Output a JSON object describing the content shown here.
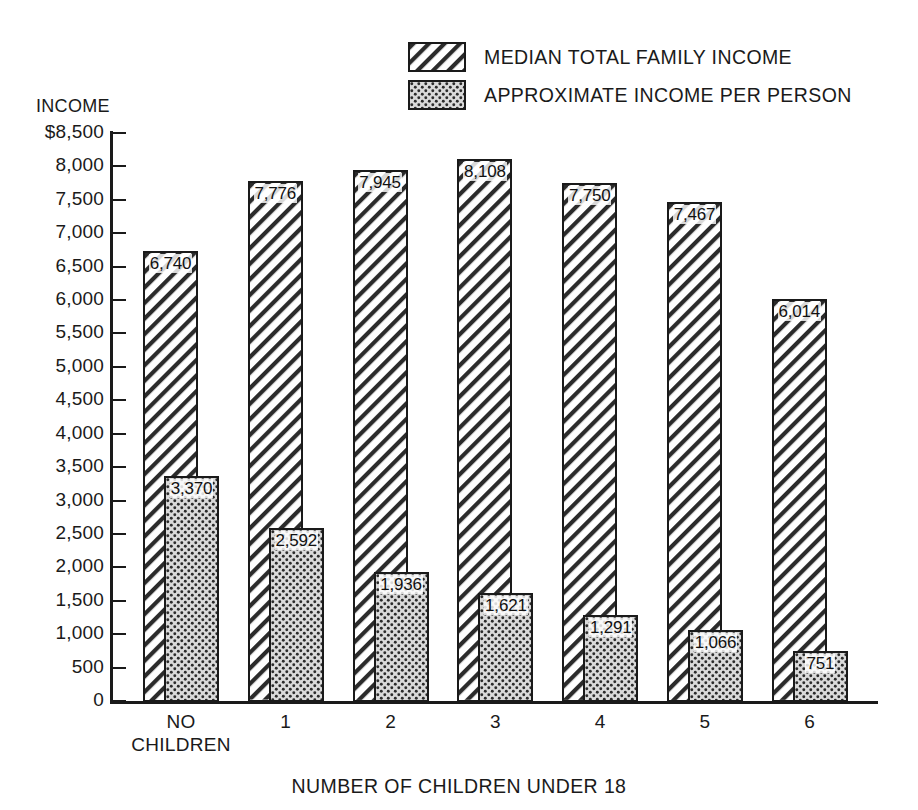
{
  "legend": {
    "items": [
      {
        "label": "MEDIAN TOTAL FAMILY INCOME",
        "pattern": "diagonal-hatch",
        "icon": "hatch-swatch-icon"
      },
      {
        "label": "APPROXIMATE INCOME PER PERSON",
        "pattern": "dotted",
        "icon": "dot-swatch-icon"
      }
    ]
  },
  "axes": {
    "y_caption": "INCOME",
    "x_title": "NUMBER OF CHILDREN UNDER 18"
  },
  "chart_data": {
    "type": "bar",
    "title": "",
    "xlabel": "NUMBER OF CHILDREN UNDER 18",
    "ylabel": "INCOME",
    "ylim": [
      0,
      8500
    ],
    "ytick_values": [
      0,
      500,
      1000,
      1500,
      2000,
      2500,
      3000,
      3500,
      4000,
      4500,
      5000,
      5500,
      6000,
      6500,
      7000,
      7500,
      8000,
      8500
    ],
    "ytick_labels": [
      "0",
      "500",
      "1,000",
      "1,500",
      "2,000",
      "2,500",
      "3,000",
      "3,500",
      "4,000",
      "4,500",
      "5,000",
      "5,500",
      "6,000",
      "6,500",
      "7,000",
      "7,500",
      "8,000",
      "$8,500"
    ],
    "grid": false,
    "legend_position": "top-right",
    "categories": [
      "NO\nCHILDREN",
      "1",
      "2",
      "3",
      "4",
      "5",
      "6"
    ],
    "series": [
      {
        "name": "MEDIAN TOTAL FAMILY INCOME",
        "pattern": "diagonal-hatch",
        "values": [
          6740,
          7776,
          7945,
          8108,
          7750,
          7467,
          6014
        ],
        "labels": [
          "6,740",
          "7,776",
          "7,945",
          "8,108",
          "7,750",
          "7,467",
          "6,014"
        ]
      },
      {
        "name": "APPROXIMATE INCOME PER PERSON",
        "pattern": "dotted",
        "values": [
          3370,
          2592,
          1936,
          1621,
          1291,
          1066,
          751
        ],
        "labels": [
          "3,370",
          "2,592",
          "1,936",
          "1,621",
          "1,291",
          "1,066",
          "751"
        ]
      }
    ]
  },
  "colors": {
    "ink": "#1a1a1a",
    "background": "#ffffff",
    "dot_fill": "#d9d9d9"
  }
}
